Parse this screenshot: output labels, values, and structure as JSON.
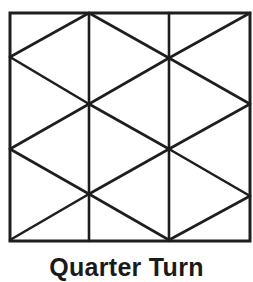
{
  "figure": {
    "caption": "Quarter Turn",
    "stroke_color": "#1e1e1e",
    "stroke_width": 2.6,
    "background": "#ffffff",
    "border": {
      "x1": 10,
      "y1": 13,
      "x2": 250,
      "y2": 241
    },
    "lines": [
      {
        "x1": 89,
        "y1": 13,
        "x2": 89,
        "y2": 241
      },
      {
        "x1": 169,
        "y1": 13,
        "x2": 169,
        "y2": 241
      },
      {
        "x1": 10,
        "y1": 57,
        "x2": 89,
        "y2": 13
      },
      {
        "x1": 89,
        "y1": 13,
        "x2": 169,
        "y2": 58
      },
      {
        "x1": 169,
        "y1": 58,
        "x2": 250,
        "y2": 13
      },
      {
        "x1": 10,
        "y1": 57,
        "x2": 89,
        "y2": 104
      },
      {
        "x1": 89,
        "y1": 104,
        "x2": 169,
        "y2": 58
      },
      {
        "x1": 169,
        "y1": 58,
        "x2": 250,
        "y2": 104
      },
      {
        "x1": 10,
        "y1": 149,
        "x2": 89,
        "y2": 104
      },
      {
        "x1": 89,
        "y1": 104,
        "x2": 169,
        "y2": 149
      },
      {
        "x1": 169,
        "y1": 149,
        "x2": 250,
        "y2": 104
      },
      {
        "x1": 10,
        "y1": 149,
        "x2": 89,
        "y2": 194
      },
      {
        "x1": 89,
        "y1": 194,
        "x2": 169,
        "y2": 149
      },
      {
        "x1": 169,
        "y1": 149,
        "x2": 250,
        "y2": 196
      },
      {
        "x1": 10,
        "y1": 240,
        "x2": 89,
        "y2": 194
      },
      {
        "x1": 89,
        "y1": 194,
        "x2": 169,
        "y2": 240
      },
      {
        "x1": 169,
        "y1": 240,
        "x2": 250,
        "y2": 196
      }
    ]
  }
}
